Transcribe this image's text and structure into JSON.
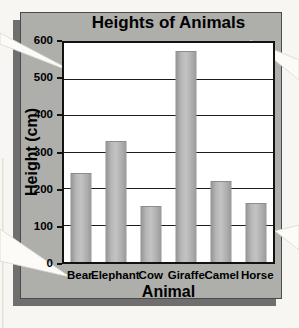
{
  "figure": {
    "title": "Heights of Animals",
    "x_axis_title": "Animal",
    "y_axis_title": "Height (cm)"
  },
  "chart_data": {
    "type": "bar",
    "title": "Heights of Animals",
    "xlabel": "Animal",
    "ylabel": "Height (cm)",
    "categories": [
      "Bear",
      "Elephant",
      "Cow",
      "Giraffe",
      "Camel",
      "Horse"
    ],
    "values": [
      240,
      330,
      150,
      575,
      220,
      160
    ],
    "ylim": [
      0,
      600
    ],
    "ytick_step": 100,
    "yticks": [
      0,
      100,
      200,
      300,
      400,
      500,
      600
    ],
    "grid": true,
    "legend": false
  },
  "colors": {
    "background": "#f7f6f2",
    "panel": "#aeaeab",
    "panel_shadow": "#6f6f6f",
    "plot_background": "#ffffff",
    "gridline": "#1c1c1c",
    "bar": "#ababab",
    "text": "#000000",
    "callout_fill": "#fcfbf7",
    "callout_edge": "#d9d8d1"
  }
}
